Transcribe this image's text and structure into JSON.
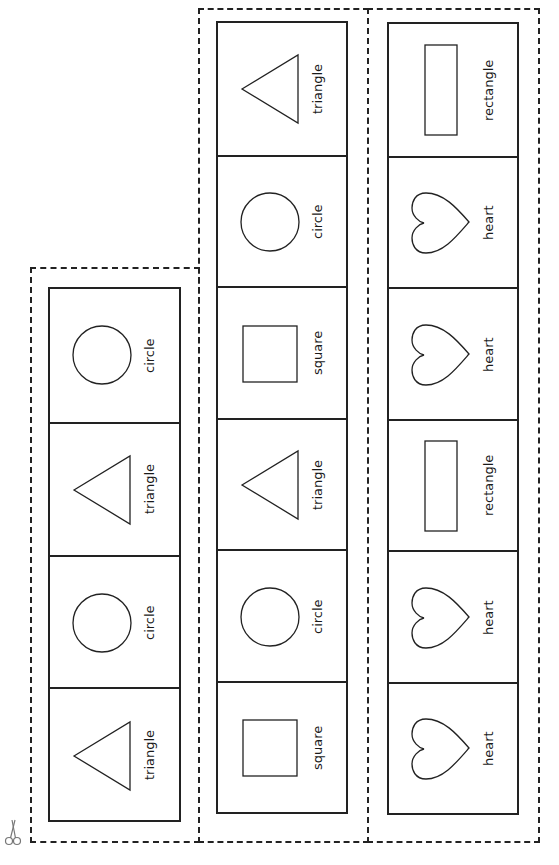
{
  "page": {
    "background": "#ffffff",
    "line_color": "#222222"
  },
  "scissors": {
    "icon": "scissors-icon"
  },
  "strips": [
    {
      "id": "left",
      "cards": [
        {
          "shape": "circle",
          "label": "circle"
        },
        {
          "shape": "triangle",
          "label": "triangle"
        },
        {
          "shape": "circle",
          "label": "circle"
        },
        {
          "shape": "triangle",
          "label": "triangle"
        }
      ]
    },
    {
      "id": "middle",
      "cards": [
        {
          "shape": "triangle",
          "label": "triangle"
        },
        {
          "shape": "circle",
          "label": "circle"
        },
        {
          "shape": "square",
          "label": "square"
        },
        {
          "shape": "triangle",
          "label": "triangle"
        },
        {
          "shape": "circle",
          "label": "circle"
        },
        {
          "shape": "square",
          "label": "square"
        }
      ]
    },
    {
      "id": "right",
      "cards": [
        {
          "shape": "rectangle",
          "label": "rectangle"
        },
        {
          "shape": "heart",
          "label": "heart"
        },
        {
          "shape": "heart",
          "label": "heart"
        },
        {
          "shape": "rectangle",
          "label": "rectangle"
        },
        {
          "shape": "heart",
          "label": "heart"
        },
        {
          "shape": "heart",
          "label": "heart"
        }
      ]
    }
  ]
}
